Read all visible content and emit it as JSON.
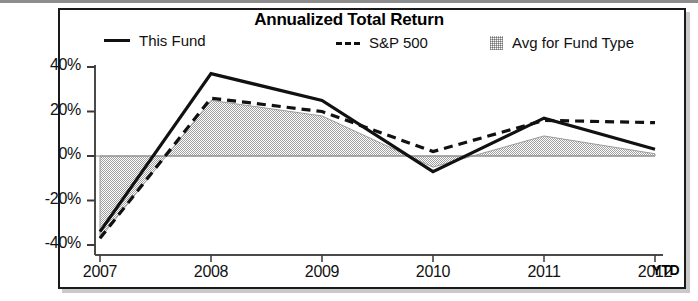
{
  "chart_data": {
    "type": "line",
    "title": "Annualized Total Return",
    "xlabel": "",
    "ylabel": "",
    "categories": [
      "2007",
      "2008",
      "2009",
      "2010",
      "2011",
      "2012"
    ],
    "x_axis_note": "YTD",
    "ylim": [
      -40,
      40
    ],
    "yticks": [
      40,
      20,
      0,
      -20,
      -40
    ],
    "ytick_labels": [
      "40%",
      "20%",
      "0%",
      "-20%",
      "-40%"
    ],
    "grid": false,
    "zero_line": true,
    "legend_position": "top",
    "series": [
      {
        "name": "This Fund",
        "style": "solid",
        "color": "#111111",
        "values": [
          -34,
          37,
          25,
          -7,
          17,
          3
        ]
      },
      {
        "name": "S&P 500",
        "style": "dashed",
        "color": "#111111",
        "values": [
          -37,
          26,
          20,
          2,
          16,
          15
        ]
      },
      {
        "name": "Avg for Fund Type",
        "style": "filled-area",
        "color": "#b5b5b5",
        "values": [
          -37,
          25,
          18,
          -5,
          9,
          1
        ]
      }
    ]
  },
  "header": {
    "title": "Annualized Total Return"
  },
  "legend": {
    "items": [
      {
        "label": "This Fund",
        "swatch": "solid-line-swatch"
      },
      {
        "label": "S&P 500",
        "swatch": "dashed-line-swatch"
      },
      {
        "label": "Avg for Fund Type",
        "swatch": "shaded-area-swatch"
      }
    ]
  },
  "axes": {
    "y_labels": [
      "40%",
      "20%",
      "0%",
      "-20%",
      "-40%"
    ],
    "x_labels": [
      "2007",
      "2008",
      "2009",
      "2010",
      "2011",
      "2012"
    ],
    "ytd_label": "YTD"
  }
}
